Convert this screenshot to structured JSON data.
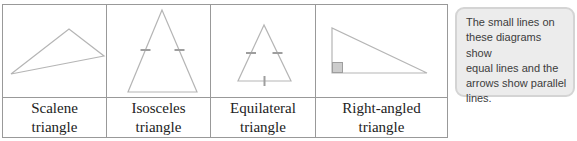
{
  "figure": {
    "type": "triangle-classification-table",
    "columns": [
      {
        "shape": "scalene-triangle",
        "label_lines": [
          "Scalene",
          "triangle"
        ]
      },
      {
        "shape": "isosceles-triangle",
        "label_lines": [
          "Isosceles",
          "triangle"
        ]
      },
      {
        "shape": "equilateral-triangle",
        "label_lines": [
          "Equilateral",
          "triangle"
        ]
      },
      {
        "shape": "right-angled-triangle",
        "label_lines": [
          "Right-angled",
          "triangle"
        ]
      }
    ],
    "markings": {
      "isosceles": "tick marks on the two equal slanted sides",
      "equilateral": "tick marks on all three sides",
      "right_angled": "small shaded square marking the right angle"
    }
  },
  "callout": {
    "lines": [
      "The small lines on",
      "these diagrams show",
      "equal lines and the",
      "arrows show parallel",
      "lines."
    ],
    "text": "The small lines on these diagrams show equal lines and the arrows show parallel lines."
  },
  "colors": {
    "table_border": "#999999",
    "triangle_stroke": "#b5b5b5",
    "tick_mark": "#9e9e9e",
    "right_angle_square_fill": "#cccccc",
    "callout_background": "#ececec",
    "callout_border": "#d4d4d4",
    "callout_text": "#3c3c3c",
    "label_text": "#222222"
  }
}
